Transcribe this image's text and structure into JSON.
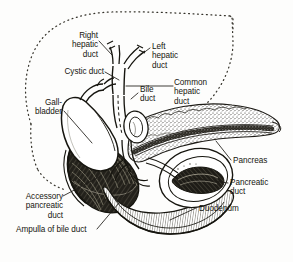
{
  "figure": {
    "background_color": "#fdfdfc",
    "ink_color": "#16150f",
    "style": "black-and-white line engraving with stipple and hatch shading"
  },
  "labels": {
    "right_hepatic_duct": "Right\nhepatic\nduct",
    "left_hepatic_duct": "Left\nhepatic\nduct",
    "cystic_duct": "Cystic duct",
    "gallbladder": "Gall-\nbladder",
    "bile_duct": "Bile\nduct",
    "common_hepatic_duct": "Common\nhepatic\nduct",
    "pancreas": "Pancreas",
    "pancreatic_duct": "Pancreatic\nduct",
    "duodenum": "Duodenum",
    "accessory_pancreatic_duct": "Accessory\npancreatic\nduct",
    "ampulla_of_bile_duct": "Ampulla of bile duct"
  },
  "structures": {
    "liver_outline": "dotted liver silhouette",
    "gallbladder_body": "pear-shaped gallbladder",
    "pancreas_body": "stippled pancreas with duct",
    "duodenum_loop": "C-shaped duodenal loop",
    "bile_duct_oval": "bile duct cross-section oval",
    "duodenal_mucosa": "dark mucosal folds interior"
  }
}
